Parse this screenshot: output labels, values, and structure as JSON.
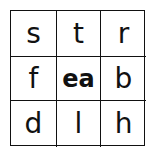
{
  "grid": {
    "cells": [
      [
        "s",
        "t",
        "r"
      ],
      [
        "f",
        "ea",
        "b"
      ],
      [
        "d",
        "l",
        "h"
      ]
    ],
    "center_label": "ea"
  }
}
